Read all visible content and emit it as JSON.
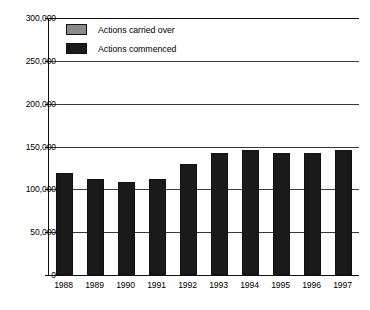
{
  "chart_data": {
    "type": "bar",
    "stacked": true,
    "title": "",
    "subtitle": "",
    "xlabel": "",
    "ylabel": "",
    "categories": [
      "1988",
      "1989",
      "1990",
      "1991",
      "1992",
      "1993",
      "1994",
      "1995",
      "1996",
      "1997"
    ],
    "series": [
      {
        "name": "Actions commenced",
        "color": "#1a1a1a",
        "values": [
          119000,
          112000,
          108000,
          112000,
          130000,
          143000,
          146000,
          143000,
          142000,
          146000
        ]
      },
      {
        "name": "Actions carried over",
        "color": "#8a8a8a",
        "values": [
          111000,
          109000,
          105000,
          100000,
          100000,
          107000,
          112000,
          114000,
          111000,
          108000
        ]
      }
    ],
    "totals": [
      230000,
      221000,
      213000,
      212000,
      230000,
      250000,
      258000,
      257000,
      253000,
      254000
    ],
    "ylim": [
      0,
      300000
    ],
    "yticks": [
      0,
      50000,
      100000,
      150000,
      200000,
      250000,
      300000
    ],
    "ytick_labels": [
      "0",
      "50,000",
      "100,000",
      "150,000",
      "200,000",
      "250,000",
      "300,000"
    ],
    "grid": true,
    "grid_axis": "y",
    "legend_position": "top-left",
    "legend": [
      "Actions carried over",
      "Actions commenced"
    ]
  },
  "legend": {
    "items": [
      {
        "label": "Actions carried over",
        "swatch": "carried",
        "color": "#8a8a8a"
      },
      {
        "label": "Actions commenced",
        "swatch": "commenced",
        "color": "#1a1a1a"
      }
    ]
  },
  "axes": {
    "y_tick_labels": [
      "300,000",
      "250,000",
      "200,000",
      "150,000",
      "100,000",
      "50,000",
      "0"
    ],
    "x_tick_labels": [
      "1988",
      "1989",
      "1990",
      "1991",
      "1992",
      "1993",
      "1994",
      "1995",
      "1996",
      "1997"
    ]
  }
}
